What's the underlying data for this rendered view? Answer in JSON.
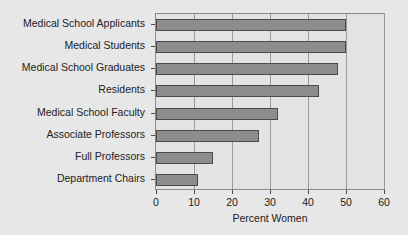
{
  "chart_data": {
    "type": "bar",
    "orientation": "horizontal",
    "title": "",
    "xlabel": "Percent Women",
    "ylabel": "",
    "xlim": [
      0,
      60
    ],
    "ylim": null,
    "grid": true,
    "legend": false,
    "xticks": [
      0,
      10,
      20,
      30,
      40,
      50,
      60
    ],
    "xtick_labels": [
      "0",
      "10",
      "20",
      "30",
      "40",
      "50",
      "60"
    ],
    "categories": [
      "Medical School Applicants",
      "Medical Students",
      "Medical School Graduates",
      "Residents",
      "Medical School Faculty",
      "Associate Professors",
      "Full Professors",
      "Department Chairs"
    ],
    "values": [
      50,
      50,
      48,
      43,
      32,
      27,
      15,
      11
    ],
    "bar_color": "#8d8d8d",
    "bar_edge_color": "#4a4a4a",
    "plot_background": "#e3e3e3",
    "figure_background": "#e7e7e7",
    "gridline_color": "#9a9a9a"
  }
}
